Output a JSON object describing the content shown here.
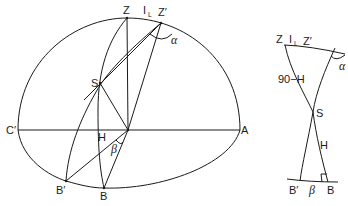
{
  "figure_left": {
    "labels": {
      "Z": "Z",
      "I": "I",
      "I_sub": "L",
      "Z_prime": "Z′",
      "alpha": "α",
      "S": "S",
      "C_prime": "C′",
      "A": "A",
      "H": "H",
      "beta": "β",
      "B_prime": "B′",
      "B": "B"
    }
  },
  "figure_right": {
    "labels": {
      "Z": "Z",
      "I": "I",
      "I_sub": "L",
      "Z_prime": "Z′",
      "alpha": "α",
      "side_90_minus_H": "90−H",
      "S": "S",
      "H": "H",
      "B_prime": "B′",
      "beta": "β",
      "B": "B"
    }
  }
}
